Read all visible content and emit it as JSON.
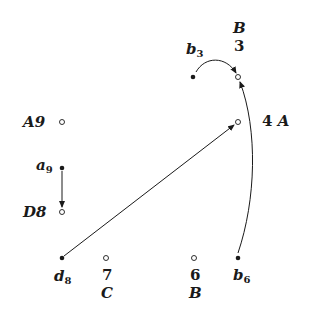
{
  "diagram": {
    "type": "move-graph",
    "colors": {
      "ink": "#1a1a1a",
      "background": "#ffffff"
    },
    "nodes": [
      {
        "id": "b3",
        "kind": "filled",
        "x": 193,
        "y": 77,
        "label_main": "b",
        "label_sub": "3"
      },
      {
        "id": "B3",
        "kind": "open",
        "x": 238,
        "y": 77,
        "label_top": "B",
        "label_bottom": "3"
      },
      {
        "id": "A9",
        "kind": "open",
        "x": 62,
        "y": 122,
        "label": "A9"
      },
      {
        "id": "4A",
        "kind": "open",
        "x": 238,
        "y": 122,
        "label": "4 A"
      },
      {
        "id": "a9",
        "kind": "filled",
        "x": 62,
        "y": 168,
        "label_main": "a",
        "label_sub": "9"
      },
      {
        "id": "D8",
        "kind": "open",
        "x": 62,
        "y": 212,
        "label": "D8"
      },
      {
        "id": "d8",
        "kind": "filled",
        "x": 62,
        "y": 258,
        "label_main": "d",
        "label_sub": "8"
      },
      {
        "id": "C7",
        "kind": "open",
        "x": 106,
        "y": 258,
        "label_top": "7",
        "label_bottom": "C"
      },
      {
        "id": "B6",
        "kind": "open",
        "x": 194,
        "y": 258,
        "label_top": "6",
        "label_bottom": "B"
      },
      {
        "id": "b6",
        "kind": "filled",
        "x": 238,
        "y": 258,
        "label_main": "b",
        "label_sub": "6"
      }
    ],
    "edges": [
      {
        "from": "b3",
        "to": "B3",
        "shape": "arc"
      },
      {
        "from": "b6",
        "to": "B3",
        "shape": "arc"
      },
      {
        "from": "d8",
        "to": "4A",
        "shape": "straight"
      },
      {
        "from": "a9",
        "to": "D8",
        "shape": "straight"
      }
    ]
  },
  "labels": {
    "b3_main": "b",
    "b3_sub": "3",
    "B3_top": "B",
    "B3_bottom": "3",
    "A9": "A9",
    "4A_num": "4",
    "4A_letter": "A",
    "a9_main": "a",
    "a9_sub": "9",
    "D8": "D8",
    "d8_main": "d",
    "d8_sub": "8",
    "C7_top": "7",
    "C7_bottom": "C",
    "B6_top": "6",
    "B6_bottom": "B",
    "b6_main": "b",
    "b6_sub": "6"
  }
}
